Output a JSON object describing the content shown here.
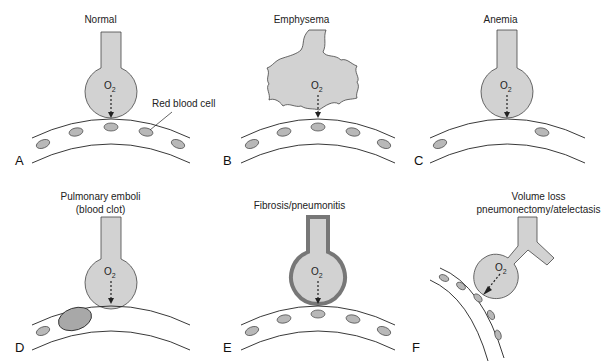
{
  "colors": {
    "alveolus_fill": "#d2d2d2",
    "outline": "#444444",
    "rbc_fill": "#b8b8b8",
    "fibrosis_wall": "#777777",
    "clot_fill": "#a8a8a8"
  },
  "labels": {
    "gas": "O",
    "gas_sub": "2",
    "rbc_callout": "Red blood cell"
  },
  "panels": [
    {
      "letter": "A",
      "title": "Normal"
    },
    {
      "letter": "B",
      "title": "Emphysema"
    },
    {
      "letter": "C",
      "title": "Anemia"
    },
    {
      "letter": "D",
      "title": "Pulmonary emboli",
      "title2": "(blood clot)"
    },
    {
      "letter": "E",
      "title": "Fibrosis/pneumonitis"
    },
    {
      "letter": "F",
      "title": "Volume loss",
      "title2": "pneumonectomy/atelectasis"
    }
  ]
}
